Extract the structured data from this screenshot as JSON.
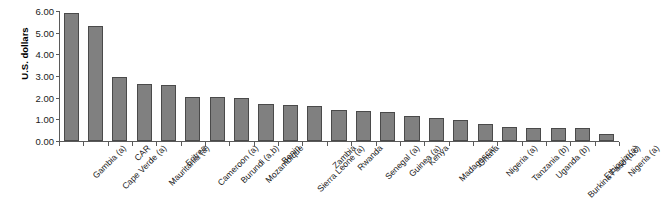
{
  "chart_data": {
    "type": "bar",
    "title": "",
    "subtitle": "",
    "xlabel": "",
    "ylabel": "U.S. dollars",
    "ylim": [
      0,
      6
    ],
    "ytick_step": 1,
    "ytick_labels": [
      "0.00",
      "1.00",
      "2.00",
      "3.00",
      "4.00",
      "5.00",
      "6.00"
    ],
    "ytick_values": [
      0,
      1,
      2,
      3,
      4,
      5,
      6
    ],
    "grid": false,
    "legend": null,
    "legend_position": "none",
    "bar_color": "#808080",
    "bar_border_color": "#4a4a4a",
    "axis_color": "#5a5a5a",
    "text_color": "#1a1a1a",
    "xtick_label_rotation": -45,
    "categories": [
      "Gambia (a)",
      "Cape Verde (a)",
      "CAR",
      "Mauritania (a)",
      "Eritrea",
      "Cameroon (a)",
      "Burundi (a,b)",
      "Mozambique",
      "Benin",
      "Sierra Leone (a)",
      "Zambia",
      "Rwanda",
      "Senegal (a)",
      "Guinea (a)",
      "Kenya",
      "Madagascar",
      "Ghana",
      "Nigeria (a)",
      "Tanzania (b)",
      "Uganda (b)",
      "Burkina Faso (b,c)",
      "Ethiopia (a)",
      "Nigeria (a)"
    ],
    "values": [
      5.9,
      5.3,
      2.95,
      2.65,
      2.6,
      2.05,
      2.05,
      2.0,
      1.7,
      1.65,
      1.6,
      1.45,
      1.4,
      1.35,
      1.15,
      1.05,
      0.95,
      0.8,
      0.65,
      0.6,
      0.6,
      0.62,
      0.32
    ]
  }
}
